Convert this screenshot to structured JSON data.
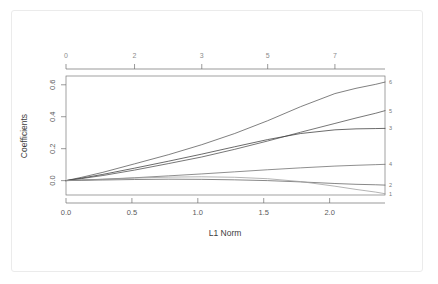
{
  "chart_data": {
    "type": "line",
    "title": "",
    "xlabel": "L1 Norm",
    "ylabel": "Coefficients",
    "xlim": [
      0.0,
      2.42
    ],
    "ylim": [
      -0.09,
      0.655
    ],
    "grid": false,
    "legend_position": "right-edge-labels",
    "xticks": [
      0.0,
      0.5,
      1.0,
      1.5,
      2.0
    ],
    "xtick_labels": [
      "0.0",
      "0.5",
      "1.0",
      "1.5",
      "2.0"
    ],
    "yticks": [
      0.0,
      0.2,
      0.4,
      0.6
    ],
    "ytick_labels": [
      "0.0",
      "0.2",
      "0.4",
      "0.6"
    ],
    "top_axis_label": "df",
    "top_ticks": [
      0.0,
      0.52,
      1.03,
      1.53,
      2.04
    ],
    "top_tick_labels": [
      "0",
      "2",
      "3",
      "5",
      "7"
    ],
    "right_labels": [
      "6",
      "5",
      "3",
      "4",
      "2",
      "1"
    ],
    "x": [
      0.0,
      0.12,
      0.28,
      0.52,
      0.78,
      1.03,
      1.28,
      1.53,
      1.78,
      2.04,
      2.2,
      2.35,
      2.42
    ],
    "series": [
      {
        "name": "6",
        "color": "#555555",
        "values": [
          0.0,
          0.021,
          0.052,
          0.105,
          0.163,
          0.225,
          0.295,
          0.375,
          0.463,
          0.545,
          0.578,
          0.603,
          0.617
        ]
      },
      {
        "name": "5",
        "color": "#4a4a4a",
        "values": [
          0.0,
          0.013,
          0.032,
          0.066,
          0.107,
          0.148,
          0.196,
          0.248,
          0.303,
          0.358,
          0.392,
          0.422,
          0.438
        ]
      },
      {
        "name": "3",
        "color": "#3a3a3a",
        "values": [
          0.0,
          0.016,
          0.039,
          0.078,
          0.122,
          0.166,
          0.212,
          0.257,
          0.295,
          0.318,
          0.324,
          0.326,
          0.327
        ]
      },
      {
        "name": "4",
        "color": "#6a6a6a",
        "values": [
          0.0,
          0.004,
          0.009,
          0.018,
          0.03,
          0.042,
          0.055,
          0.068,
          0.08,
          0.091,
          0.096,
          0.1,
          0.102
        ]
      },
      {
        "name": "2",
        "color": "#606060",
        "values": [
          0.0,
          0.002,
          0.004,
          0.007,
          0.009,
          0.008,
          0.005,
          0.0,
          -0.008,
          -0.018,
          -0.023,
          -0.026,
          -0.028
        ]
      },
      {
        "name": "1",
        "color": "#9b9b9b",
        "values": [
          0.0,
          0.003,
          0.008,
          0.016,
          0.022,
          0.024,
          0.021,
          0.012,
          -0.006,
          -0.035,
          -0.055,
          -0.072,
          -0.082
        ]
      }
    ]
  }
}
